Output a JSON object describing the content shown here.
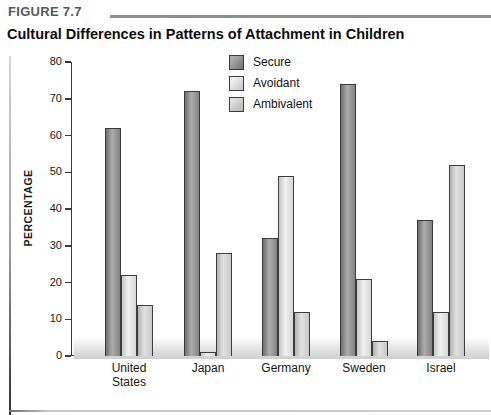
{
  "header": {
    "figure_label": "FIGURE 7.7",
    "title": "Cultural Differences in Patterns of Attachment in Children"
  },
  "chart_data": {
    "type": "bar",
    "title": "Cultural Differences in Patterns of Attachment in Children",
    "categories": [
      "United States",
      "Japan",
      "Germany",
      "Sweden",
      "Israel"
    ],
    "series": [
      {
        "name": "Secure",
        "values": [
          62,
          72,
          32,
          74,
          37
        ],
        "color": {
          "edge": "#6f6f6f",
          "mid": "#adadad",
          "end": "#828282",
          "border": "#3a3a3a"
        }
      },
      {
        "name": "Avoidant",
        "values": [
          22,
          1,
          49,
          21,
          12
        ],
        "color": {
          "edge": "#c6c6c6",
          "mid": "#f1f1f1",
          "end": "#d6d6d6",
          "border": "#3d3d3d"
        }
      },
      {
        "name": "Ambivalent",
        "values": [
          14,
          28,
          12,
          4,
          52
        ],
        "color": {
          "edge": "#b2b2b2",
          "mid": "#e2e2e2",
          "end": "#c8c8c8",
          "border": "#3d3d3d"
        }
      }
    ],
    "xlabel": "",
    "ylabel": "PERCENTAGE",
    "ylim": [
      0,
      80
    ],
    "yticks": [
      0,
      10,
      20,
      30,
      40,
      50,
      60,
      70,
      80
    ],
    "grid": false,
    "legend_position": "top-center"
  }
}
